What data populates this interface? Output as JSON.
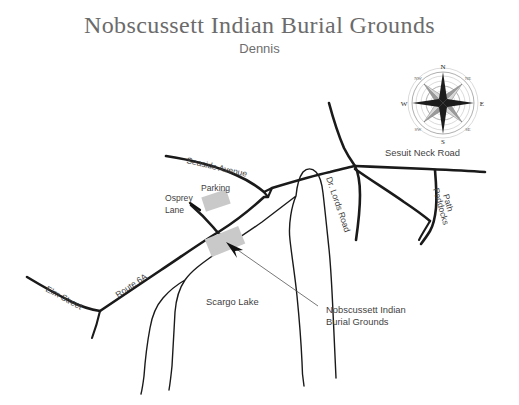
{
  "header": {
    "title": "Nobscussett Indian Burial Grounds",
    "subtitle": "Dennis"
  },
  "compass": {
    "name": "compass-rose",
    "north": "N",
    "south": "S",
    "east": "E",
    "west": "W",
    "northeast": "NE",
    "northwest": "NW",
    "southeast": "SE",
    "southwest": "SW"
  },
  "map": {
    "roads": [
      {
        "name": "seaside-avenue",
        "label": "Seaside Avenue"
      },
      {
        "name": "osprey-lane",
        "label": "Osprey Lane",
        "label_line1": "Osprey",
        "label_line2": "Lane"
      },
      {
        "name": "route-6a",
        "label": "Route 6A"
      },
      {
        "name": "elm-street",
        "label": "Elm Street"
      },
      {
        "name": "dr-lords-road",
        "label": "Dr. Lords Road"
      },
      {
        "name": "sesuit-neck-road",
        "label": "Sesuit Neck Road"
      },
      {
        "name": "paddocks-path",
        "label": "Paddocks Path",
        "label_line1": "Paddocks",
        "label_line2": "Path"
      }
    ],
    "features": [
      {
        "name": "scargo-lake",
        "label": "Scargo Lake"
      },
      {
        "name": "parking-area",
        "label": "Parking"
      },
      {
        "name": "burial-grounds-plot",
        "label_line1": "Nobscussett Indian",
        "label_line2": "Burial Grounds"
      }
    ],
    "colors": {
      "road_stroke": "#1a1a1a",
      "plot_fill": "#c9c9c9",
      "lake_stroke": "#1a1a1a",
      "label_text": "#3f3f3f",
      "title_text": "#6b6b6b",
      "background": "#ffffff"
    }
  }
}
